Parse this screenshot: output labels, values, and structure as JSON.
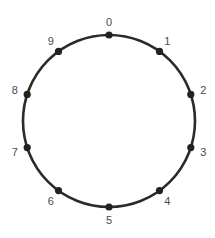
{
  "diagram": {
    "type": "circular-node-ring",
    "center": [
      109,
      121
    ],
    "radius": 86,
    "ring_color": "#2a2a2a",
    "node_color": "#222222",
    "label_color": "#4a4a4a",
    "nodes": [
      {
        "label": "0"
      },
      {
        "label": "1"
      },
      {
        "label": "2"
      },
      {
        "label": "3"
      },
      {
        "label": "4"
      },
      {
        "label": "5"
      },
      {
        "label": "6"
      },
      {
        "label": "7"
      },
      {
        "label": "8"
      },
      {
        "label": "9"
      }
    ]
  }
}
